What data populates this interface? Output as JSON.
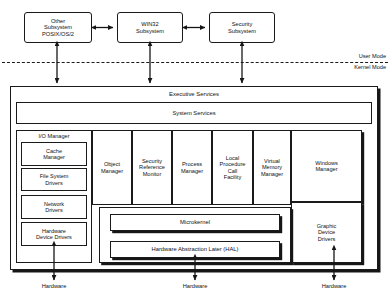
{
  "diagram": {
    "user_mode_label": "User Mode",
    "kernel_mode_label": "Kernel Mode",
    "subsystems": [
      {
        "id": "other",
        "label": "Other\nSubsystem\nPOSIX/OS/2"
      },
      {
        "id": "win32",
        "label": "WIN32\nSubsystem"
      },
      {
        "id": "security",
        "label": "Security\nSubsystem"
      }
    ],
    "executive": {
      "label": "Executive Services",
      "system_services_label": "System Services"
    },
    "io_manager": {
      "title": "I/O Manager",
      "children": [
        {
          "id": "cache",
          "label": "Cache\nManager"
        },
        {
          "id": "filesystem",
          "label": "File System\nDrivers"
        },
        {
          "id": "network",
          "label": "Network\nDrivers"
        },
        {
          "id": "hwdrivers",
          "label": "Hardware\nDevice Drivers"
        }
      ]
    },
    "executive_components": [
      {
        "id": "object-manager",
        "label": "Object\nManager"
      },
      {
        "id": "security-reference-monitor",
        "label": "Security\nReference\nMonitor"
      },
      {
        "id": "process-manager",
        "label": "Process\nManager"
      },
      {
        "id": "lpc-facility",
        "label": "Local\nProcedure\nCall\nFacility"
      },
      {
        "id": "virtual-memory-manager",
        "label": "Virtual\nMemory\nManager"
      }
    ],
    "windows_manager": {
      "id": "windows-manager",
      "label": "Windows\nManager"
    },
    "graphic_device_drivers": {
      "id": "graphic-device-drivers",
      "label": "Graphic\nDevice\nDrivers"
    },
    "kernel_core": [
      {
        "id": "microkernel",
        "label": "Microkernel"
      },
      {
        "id": "hal",
        "label": "Hardware Abstraction Later (HAL)"
      }
    ],
    "hardware_labels": [
      {
        "id": "hardware-left",
        "label": "Hardware"
      },
      {
        "id": "hardware-center",
        "label": "Hardware"
      },
      {
        "id": "hardware-right",
        "label": "Hardware"
      }
    ],
    "colors": {
      "stroke": "#1a1a1a",
      "shadow": "#161616",
      "background": "#ffffff",
      "text": "#111111"
    }
  }
}
